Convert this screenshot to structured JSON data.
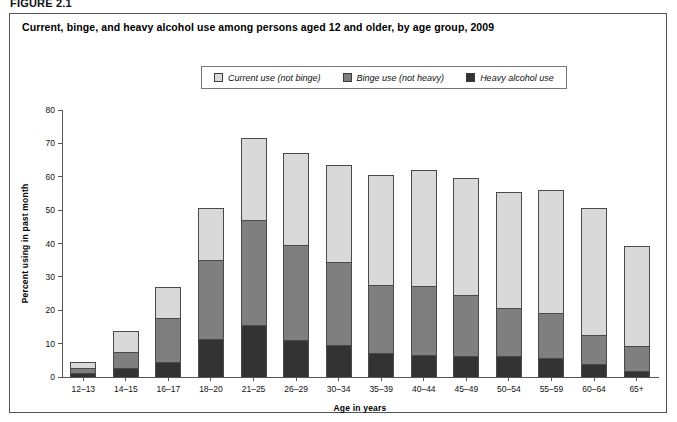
{
  "figure_label": "FIGURE 2.1",
  "chart_title": "Current, binge, and heavy alcohol use among persons aged 12 and older, by age group, 2009",
  "legend": {
    "position": "top-center",
    "items": [
      {
        "label": "Current use (not binge)",
        "color": "#d9d9d9",
        "icon": "legend-swatch-icon"
      },
      {
        "label": "Binge use (not heavy)",
        "color": "#7f7f7f",
        "icon": "legend-swatch-icon"
      },
      {
        "label": "Heavy alcohol use",
        "color": "#333333",
        "icon": "legend-swatch-icon"
      }
    ]
  },
  "chart_data": {
    "type": "bar",
    "stacked": true,
    "title": "Current, binge, and heavy alcohol use among persons aged 12 and older, by age group, 2009",
    "xlabel": "Age in years",
    "ylabel": "Percent using in past month",
    "ylim": [
      0,
      80
    ],
    "yticks": [
      0,
      10,
      20,
      30,
      40,
      50,
      60,
      70,
      80
    ],
    "grid": false,
    "legend_position": "top-center",
    "categories": [
      "12–13",
      "14–15",
      "16–17",
      "18–20",
      "21–25",
      "26–29",
      "30–34",
      "35–39",
      "40–44",
      "45–49",
      "50–54",
      "55–59",
      "60–64",
      "65+"
    ],
    "series": [
      {
        "name": "Heavy alcohol use",
        "color": "#333333",
        "values": [
          0.9,
          2.5,
          4.3,
          11.2,
          15.4,
          10.7,
          9.3,
          7.0,
          6.4,
          6.1,
          5.9,
          5.4,
          3.7,
          1.6
        ]
      },
      {
        "name": "Binge use (not heavy)",
        "color": "#7f7f7f",
        "values": [
          1.2,
          4.5,
          12.7,
          23.3,
          30.9,
          28.2,
          24.7,
          20.0,
          20.3,
          17.9,
          14.2,
          13.2,
          8.3,
          7.2
        ]
      },
      {
        "name": "Current use (not binge)",
        "color": "#d9d9d9",
        "values": [
          1.4,
          6.0,
          9.2,
          15.2,
          24.4,
          27.4,
          28.5,
          32.5,
          34.3,
          34.6,
          34.5,
          36.6,
          37.8,
          29.5
        ]
      }
    ],
    "totals": [
      3.5,
      13.0,
      26.2,
      49.7,
      70.7,
      66.3,
      62.5,
      59.5,
      61.0,
      58.6,
      54.6,
      55.2,
      49.8,
      38.3
    ]
  }
}
